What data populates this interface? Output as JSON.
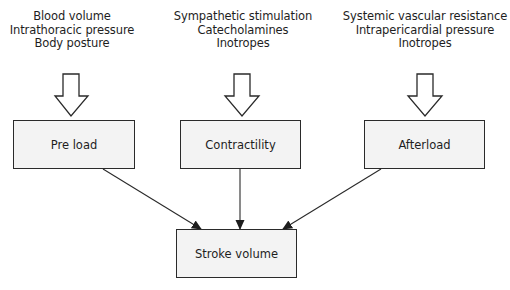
{
  "diagram": {
    "factor_groups": [
      {
        "id": "preload",
        "lines": [
          "Blood volume",
          "Intrathoracic pressure",
          "Body posture"
        ],
        "box_label": "Pre load"
      },
      {
        "id": "contractility",
        "lines": [
          "Sympathetic stimulation",
          "Catecholamines",
          "Inotropes"
        ],
        "box_label": "Contractility"
      },
      {
        "id": "afterload",
        "lines": [
          "Systemic vascular resistance",
          "Intrapericardial pressure",
          "Inotropes"
        ],
        "box_label": "Afterload"
      }
    ],
    "outcome": {
      "box_label": "Stroke volume"
    },
    "colors": {
      "box_fill": "#f3f3f3",
      "stroke": "#2a2a2a",
      "text": "#1e1e1e",
      "background": "#ffffff"
    }
  }
}
